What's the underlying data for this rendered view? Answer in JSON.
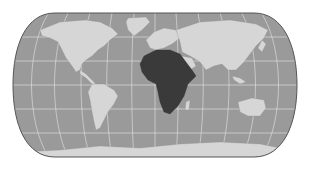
{
  "map": {
    "projection": "eckert-like pseudocylindrical",
    "highlighted_region": "Africa",
    "colors": {
      "background": "#ffffff",
      "ocean": "#9a9a9a",
      "land": "#d6d6d6",
      "highlight": "#3a3a3a",
      "graticule": "#e6e6e6",
      "outline": "#555555"
    },
    "labels": []
  }
}
